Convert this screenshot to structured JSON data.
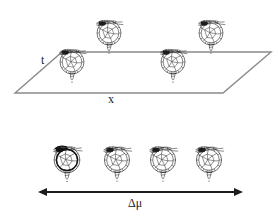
{
  "figure": {
    "background_color": "#ffffff",
    "ink_color": "#1c1c1c",
    "plane_color": "#8a8a8a",
    "panels": [
      {
        "id": "upper-panel",
        "description": "perspective plane with four embryo drawings above it",
        "axis_labels": [
          {
            "name": "t",
            "text": "t",
            "x": 41,
            "y": 54
          },
          {
            "name": "x",
            "text": "x",
            "x": 108,
            "y": 93
          }
        ],
        "plane": {
          "name": "xt-plane",
          "points": [
            {
              "x": 62,
              "y": 52
            },
            {
              "x": 271,
              "y": 52
            },
            {
              "x": 223,
              "y": 93
            },
            {
              "x": 15,
              "y": 93
            }
          ]
        },
        "specimens": [
          {
            "index": 1,
            "cx": 72,
            "cy": 62,
            "scale": 1.0,
            "bold_outline": false
          },
          {
            "index": 2,
            "cx": 109,
            "cy": 33,
            "scale": 1.0,
            "bold_outline": false
          },
          {
            "index": 3,
            "cx": 173,
            "cy": 62,
            "scale": 1.0,
            "bold_outline": false
          },
          {
            "index": 4,
            "cx": 211,
            "cy": 33,
            "scale": 1.0,
            "bold_outline": false
          }
        ]
      },
      {
        "id": "lower-panel",
        "description": "row of four embryo drawings over a double headed arrow",
        "axis_labels": [
          {
            "name": "delta-mu",
            "text": "Δμ",
            "x": 128,
            "y": 197
          }
        ],
        "arrow": {
          "name": "delta-mu-arrow",
          "x1": 45,
          "x2": 236,
          "y": 192,
          "double_headed": true
        },
        "specimens": [
          {
            "index": 1,
            "cx": 67,
            "cy": 162,
            "scale": 1.03,
            "bold_outline": true
          },
          {
            "index": 2,
            "cx": 117,
            "cy": 162,
            "scale": 1.0,
            "bold_outline": false
          },
          {
            "index": 3,
            "cx": 163,
            "cy": 162,
            "scale": 1.0,
            "bold_outline": false
          },
          {
            "index": 4,
            "cx": 209,
            "cy": 162,
            "scale": 1.0,
            "bold_outline": false
          }
        ]
      }
    ]
  }
}
